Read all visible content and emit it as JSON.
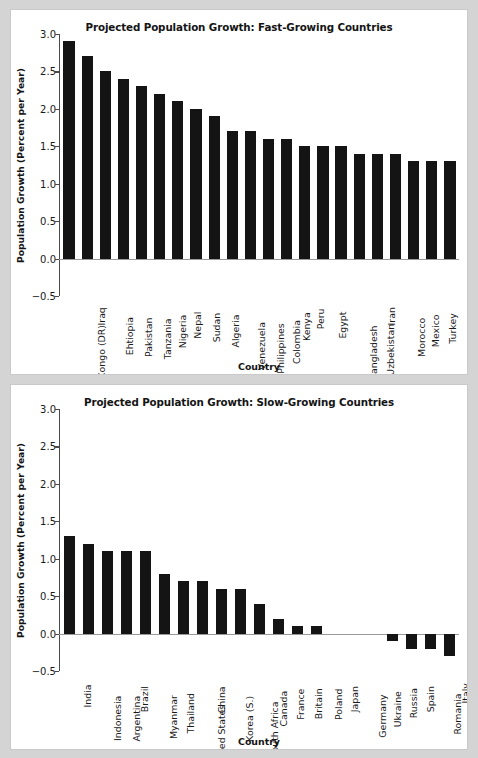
{
  "chart_data": [
    {
      "type": "bar",
      "title": "Projected Population Growth: Fast-Growing Countries",
      "xlabel": "Country",
      "ylabel": "Population Growth (Percent per Year)",
      "ylim": [
        -0.5,
        3.0
      ],
      "yticks": [
        -0.5,
        0.0,
        0.5,
        1.0,
        1.5,
        2.0,
        2.5,
        3.0
      ],
      "ytick_labels": [
        "−0.5",
        "0.0",
        "0.5",
        "1.0",
        "1.5",
        "2.0",
        "2.5",
        "3.0"
      ],
      "grid": false,
      "legend": "none",
      "bar_color": "#141414",
      "categories": [
        "Congo (DR)",
        "Iraq",
        "Ehtiopia",
        "Pakistan",
        "Tanzania",
        "Nigeria",
        "Nepal",
        "Sudan",
        "Algeria",
        "Venezuela",
        "Philippines",
        "Colombia",
        "Kenya",
        "Peru",
        "Egypt",
        "Bangladesh",
        "Uzbekistan",
        "Iran",
        "Morocco",
        "Mexico",
        "Turkey",
        "Vietnam"
      ],
      "values": [
        2.9,
        2.7,
        2.5,
        2.4,
        2.3,
        2.2,
        2.1,
        2.0,
        1.9,
        1.7,
        1.7,
        1.6,
        1.6,
        1.5,
        1.5,
        1.5,
        1.4,
        1.4,
        1.4,
        1.3,
        1.3,
        1.3
      ]
    },
    {
      "type": "bar",
      "title": "Projected Population Growth: Slow-Growing Countries",
      "xlabel": "Country",
      "ylabel": "Population Growth (Percent per Year)",
      "ylim": [
        -0.5,
        3.0
      ],
      "yticks": [
        -0.5,
        0.0,
        0.5,
        1.0,
        1.5,
        2.0,
        2.5,
        3.0
      ],
      "ytick_labels": [
        "−0.5",
        "0.0",
        "0.5",
        "1.0",
        "1.5",
        "2.0",
        "2.5",
        "3.0"
      ],
      "grid": false,
      "legend": "none",
      "bar_color": "#141414",
      "categories": [
        "India",
        "Indonesia",
        "Argentina",
        "Brazil",
        "Myanmar",
        "Thailand",
        "United States",
        "China",
        "Korea (S.)",
        "South Africa",
        "Canada",
        "France",
        "Britain",
        "Poland",
        "Japan",
        "Germany",
        "Ukraine",
        "Russia",
        "Spain",
        "Romania",
        "Italy"
      ],
      "values": [
        1.3,
        1.2,
        1.1,
        1.1,
        1.1,
        0.8,
        0.7,
        0.7,
        0.6,
        0.6,
        0.4,
        0.2,
        0.1,
        0.1,
        0.0,
        0.0,
        0.0,
        -0.1,
        -0.2,
        -0.2,
        -0.3
      ]
    }
  ]
}
